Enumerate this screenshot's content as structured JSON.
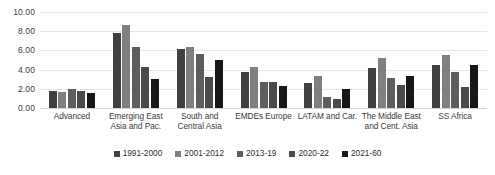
{
  "chart_data": {
    "type": "bar",
    "title": "",
    "subtitle": "",
    "xlabel": "",
    "ylabel": "",
    "ylim": [
      0,
      10
    ],
    "ytick_labels": [
      "10.00",
      "8.00",
      "6.00",
      "4.00",
      "2.00",
      "0.00"
    ],
    "ytick_values": [
      10,
      8,
      6,
      4,
      2,
      0
    ],
    "grid": true,
    "legend_position": "bottom",
    "categories": [
      "Advanced",
      "Emerging East Asia and Pac.",
      "South and Central Asia",
      "EMDEs Europe",
      "LATAM and Car.",
      "The Middle East and Cent. Asia",
      "SS Africa"
    ],
    "series": [
      {
        "name": "1991-2000",
        "color": "#404040",
        "values": [
          1.8,
          7.8,
          6.1,
          3.8,
          2.6,
          4.2,
          4.5
        ]
      },
      {
        "name": "2001-2012",
        "color": "#7f7f7f",
        "values": [
          1.7,
          8.6,
          6.4,
          4.3,
          3.3,
          5.2,
          5.5
        ]
      },
      {
        "name": "2013-19",
        "color": "#5e5e5e",
        "values": [
          2.0,
          6.4,
          5.6,
          2.7,
          1.1,
          3.1,
          3.7
        ]
      },
      {
        "name": "2020-22",
        "color": "#4a4a4a",
        "values": [
          1.75,
          4.3,
          3.2,
          2.7,
          0.9,
          2.4,
          2.2
        ]
      },
      {
        "name": "2021-60",
        "color": "#171717",
        "values": [
          1.55,
          3.0,
          5.0,
          2.3,
          2.0,
          3.3,
          4.5
        ]
      }
    ]
  },
  "colors": {
    "background": "#ffffff",
    "gridline": "#e6e6e6",
    "baseline": "#d2d2d2",
    "text": "#3b3b3b"
  }
}
